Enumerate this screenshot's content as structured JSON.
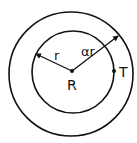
{
  "diagram": {
    "labels": {
      "center": "R",
      "inner_radius": "r",
      "outer_radius": "αr",
      "point": "T"
    },
    "colors": {
      "stroke": "#111111",
      "background": "#ffffff"
    }
  }
}
